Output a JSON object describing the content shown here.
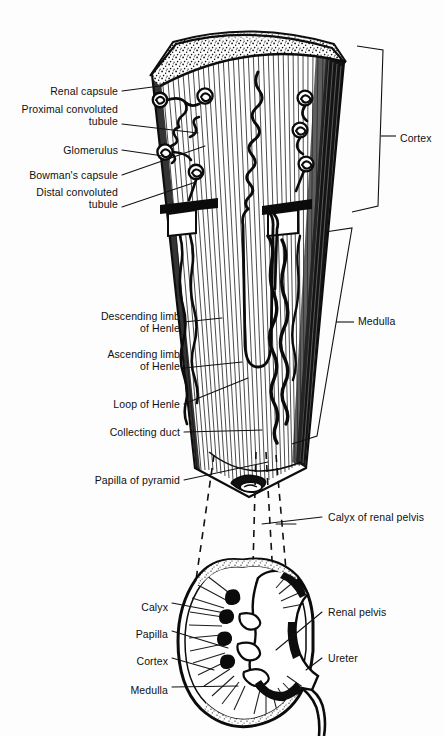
{
  "figure": {
    "background_color": "#fdfdfd",
    "ink_color": "#101010"
  },
  "nephron_labels": [
    {
      "id": "renal-capsule",
      "text": "Renal capsule",
      "align": "right",
      "x": 118,
      "y": 91,
      "lines": [
        "Renal capsule"
      ]
    },
    {
      "id": "proximal-tubule",
      "text": "Proximal convoluted tubule",
      "align": "right",
      "x": 118,
      "y": 115,
      "lines": [
        "Proximal convoluted",
        "tubule"
      ]
    },
    {
      "id": "glomerulus",
      "text": "Glomerulus",
      "align": "right",
      "x": 118,
      "y": 150,
      "lines": [
        "Glomerulus"
      ]
    },
    {
      "id": "bowmans-capsule",
      "text": "Bowman's capsule",
      "align": "right",
      "x": 118,
      "y": 175,
      "lines": [
        "Bowman's capsule"
      ]
    },
    {
      "id": "distal-tubule",
      "text": "Distal convoluted tubule",
      "align": "right",
      "x": 118,
      "y": 198,
      "lines": [
        "Distal convoluted",
        "tubule"
      ]
    },
    {
      "id": "descending-limb",
      "text": "Descending limb of Henle",
      "align": "right",
      "x": 180,
      "y": 322,
      "lines": [
        "Descending limb",
        "of Henle"
      ]
    },
    {
      "id": "ascending-limb",
      "text": "Ascending limb of Henle",
      "align": "right",
      "x": 180,
      "y": 360,
      "lines": [
        "Ascending limb",
        "of Henle"
      ]
    },
    {
      "id": "loop-of-henle",
      "text": "Loop of Henle",
      "align": "right",
      "x": 180,
      "y": 404,
      "lines": [
        "Loop of Henle"
      ]
    },
    {
      "id": "collecting-duct",
      "text": "Collecting duct",
      "align": "right",
      "x": 180,
      "y": 432,
      "lines": [
        "Collecting duct"
      ]
    },
    {
      "id": "papilla-of-pyramid",
      "text": "Papilla of pyramid",
      "align": "right",
      "x": 180,
      "y": 480,
      "lines": [
        "Papilla of pyramid"
      ]
    }
  ],
  "bracket_labels": [
    {
      "id": "cortex-bracket",
      "text": "Cortex",
      "align": "left",
      "x": 400,
      "y": 138
    },
    {
      "id": "medulla-bracket",
      "text": "Medulla",
      "align": "left",
      "x": 358,
      "y": 321
    }
  ],
  "link_labels": [
    {
      "id": "calyx-of-renal-pelvis",
      "text": "Calyx of renal pelvis",
      "align": "left",
      "x": 328,
      "y": 517
    }
  ],
  "kidney_labels_left": [
    {
      "id": "calyx",
      "text": "Calyx",
      "align": "right",
      "x": 168,
      "y": 607
    },
    {
      "id": "papilla",
      "text": "Papilla",
      "align": "right",
      "x": 168,
      "y": 634
    },
    {
      "id": "cortex",
      "text": "Cortex",
      "align": "right",
      "x": 168,
      "y": 661
    },
    {
      "id": "medulla",
      "text": "Medulla",
      "align": "right",
      "x": 168,
      "y": 690
    }
  ],
  "kidney_labels_right": [
    {
      "id": "renal-pelvis",
      "text": "Renal pelvis",
      "align": "left",
      "x": 328,
      "y": 612
    },
    {
      "id": "ureter",
      "text": "Ureter",
      "align": "left",
      "x": 328,
      "y": 658
    }
  ],
  "brackets": {
    "cortex": {
      "top_y": 46,
      "bottom_y": 212,
      "x": 382
    },
    "medulla": {
      "top_y": 232,
      "bottom_y": 440,
      "x": 352
    }
  }
}
